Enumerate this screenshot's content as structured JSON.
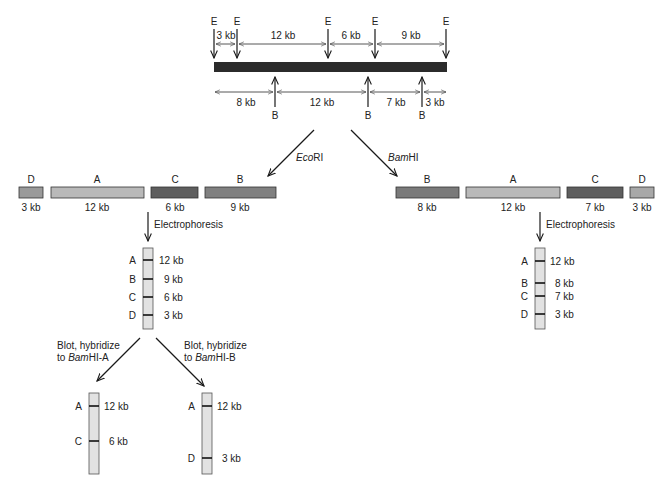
{
  "diagram": {
    "map": {
      "ecori_label": "E",
      "ecori_sites_x": [
        214,
        237,
        328,
        375,
        446
      ],
      "ecori_intervals": [
        "3 kb",
        "12 kb",
        "6 kb",
        "9 kb"
      ],
      "bamhi_label": "B",
      "bamhi_sites_x": [
        275,
        368,
        422
      ],
      "bamhi_intervals": [
        "8 kb",
        "12 kb",
        "7 kb",
        "3 kb"
      ],
      "dna_color": "#2b2b2b"
    },
    "digests": {
      "ecori": {
        "enzyme_prefix": "Eco",
        "enzyme_suffix": "RI",
        "fragments": [
          {
            "letter": "D",
            "size": "3 kb",
            "color": "#9a9a9a"
          },
          {
            "letter": "A",
            "size": "12 kb",
            "color": "#b9b9b9"
          },
          {
            "letter": "C",
            "size": "6 kb",
            "color": "#5e5e5e"
          },
          {
            "letter": "B",
            "size": "9 kb",
            "color": "#808080"
          }
        ]
      },
      "bamhi": {
        "enzyme_prefix": "Bam",
        "enzyme_suffix": "HI",
        "fragments": [
          {
            "letter": "B",
            "size": "8 kb",
            "color": "#7a7a7a"
          },
          {
            "letter": "A",
            "size": "12 kb",
            "color": "#b9b9b9"
          },
          {
            "letter": "C",
            "size": "7 kb",
            "color": "#5e5e5e"
          },
          {
            "letter": "D",
            "size": "3 kb",
            "color": "#a8a8a8"
          }
        ]
      }
    },
    "electrophoresis_label": "Electrophoresis",
    "gels": {
      "ecori": {
        "bands": [
          {
            "letter": "A",
            "size": "12 kb"
          },
          {
            "letter": "B",
            "size": "9 kb"
          },
          {
            "letter": "C",
            "size": "6 kb"
          },
          {
            "letter": "D",
            "size": "3 kb"
          }
        ]
      },
      "bamhi": {
        "bands": [
          {
            "letter": "A",
            "size": "12 kb"
          },
          {
            "letter": "B",
            "size": "8 kb"
          },
          {
            "letter": "C",
            "size": "7 kb"
          },
          {
            "letter": "D",
            "size": "3 kb"
          }
        ]
      }
    },
    "blots": {
      "probe_a": {
        "line1": "Blot, hybridize",
        "line2_prefix": "to ",
        "line2_italic": "Bam",
        "line2_suffix": "HI-A",
        "bands": [
          {
            "letter": "A",
            "size": "12 kb"
          },
          {
            "letter": "C",
            "size": "6 kb"
          }
        ]
      },
      "probe_b": {
        "line1": "Blot, hybridize",
        "line2_prefix": "to ",
        "line2_italic": "Bam",
        "line2_suffix": "HI-B",
        "bands": [
          {
            "letter": "A",
            "size": "12 kb"
          },
          {
            "letter": "D",
            "size": "3 kb"
          }
        ]
      }
    }
  }
}
